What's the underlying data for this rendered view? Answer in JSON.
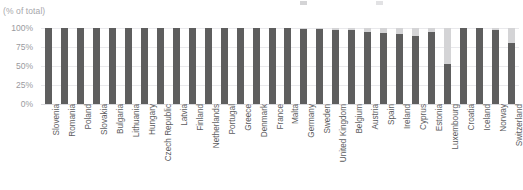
{
  "axis_subtitle": "(% of total)",
  "colors": {
    "series_dark": "#5e5e5e",
    "series_light": "#d4d4d6",
    "gridline": "#e9e9ec",
    "label_text": "#5c5c60",
    "tick_text": "#9a9a9e",
    "subtitle_text": "#a6a6aa",
    "background": "#ffffff"
  },
  "legend": [
    {
      "label": "",
      "color": "#d4d4d6"
    },
    {
      "label": "",
      "color": "#e2e2e4"
    }
  ],
  "chart_data": {
    "type": "bar",
    "stacked": true,
    "title": "",
    "subtitle": "(% of total)",
    "xlabel": "",
    "ylabel": "",
    "ylim": [
      0,
      100
    ],
    "yticks": [
      "0%",
      "25%",
      "50%",
      "75%",
      "100%"
    ],
    "ytick_values": [
      0,
      25,
      50,
      75,
      100
    ],
    "grid": true,
    "legend_position": "top",
    "categories": [
      "Slovenia",
      "Romania",
      "Poland",
      "Slovakia",
      "Bulgaria",
      "Lithuania",
      "Hungary",
      "Czech Republic",
      "Latvia",
      "Finland",
      "Netherlands",
      "Portugal",
      "Greece",
      "Denmark",
      "France",
      "Malta",
      "Germany",
      "Sweden",
      "United Kingdom",
      "Belgium",
      "Austria",
      "Spain",
      "Ireland",
      "Cyprus",
      "Estonia",
      "Luxembourg",
      "Croatia",
      "Iceland",
      "Norway",
      "Switzerland"
    ],
    "series": [
      {
        "name": "primary",
        "color": "#5e5e5e",
        "values": [
          100,
          100,
          100,
          100,
          100,
          100,
          100,
          100,
          100,
          100,
          100,
          100,
          100,
          100,
          100,
          100,
          99,
          99,
          98,
          97,
          95,
          93,
          92,
          90,
          95,
          53,
          100,
          100,
          98,
          80
        ]
      },
      {
        "name": "secondary",
        "color": "#d4d4d6",
        "values": [
          0,
          0,
          0,
          0,
          0,
          0,
          0,
          0,
          0,
          0,
          0,
          0,
          0,
          0,
          0,
          0,
          1,
          1,
          2,
          3,
          5,
          7,
          8,
          10,
          5,
          47,
          0,
          0,
          2,
          20
        ]
      }
    ]
  }
}
